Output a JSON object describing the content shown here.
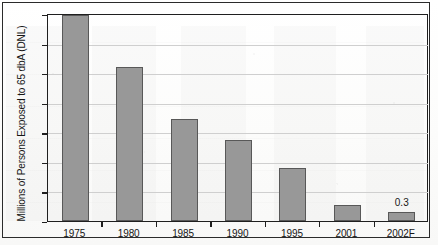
{
  "chart_data": {
    "type": "bar",
    "title": "",
    "subtitle": "",
    "xlabel": "",
    "ylabel": "Millions of Persons Exposed to 65 dbA (DNL)",
    "categories": [
      "1975",
      "1980",
      "1985",
      "1990",
      "1995",
      "2001",
      "2002F"
    ],
    "values": [
      7.0,
      5.2,
      3.45,
      2.75,
      1.8,
      0.55,
      0.3
    ],
    "data_labels": [
      "",
      "",
      "",
      "",
      "",
      "",
      "0.3"
    ],
    "ylim": [
      0.0,
      7.0
    ],
    "y_ticks": [
      "0.0",
      "1.0",
      "2.0",
      "3.0",
      "4.0",
      "5.0",
      "6.0",
      "7.0"
    ],
    "y_tick_values": [
      0.0,
      1.0,
      2.0,
      3.0,
      4.0,
      5.0,
      6.0,
      7.0
    ],
    "grid": true,
    "legend": "none",
    "bar_color": "#989898",
    "bar_border_color": "#585858",
    "axis_color": "#1f1f1f",
    "gridline_color": "#cfcfcf",
    "background_color": "#fdfdfd"
  }
}
